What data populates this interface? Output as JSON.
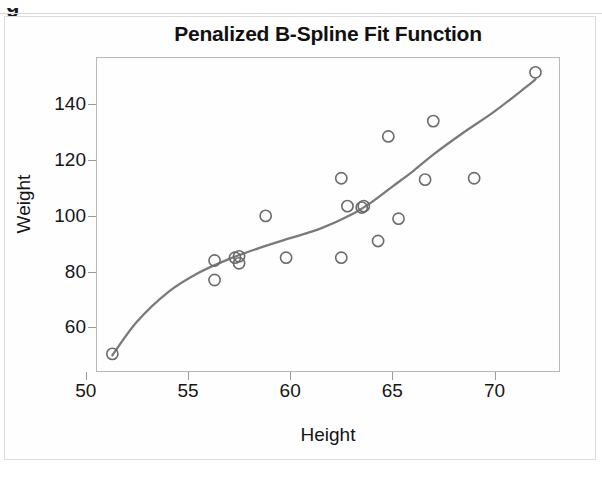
{
  "page": {
    "clipped_caption_glyph": "g"
  },
  "chart_data": {
    "type": "scatter",
    "title": "Penalized B-Spline Fit Function",
    "xlabel": "Height",
    "ylabel": "Weight",
    "xlim": [
      50.5,
      73.2
    ],
    "ylim": [
      44,
      157
    ],
    "xticks": [
      50,
      55,
      60,
      65,
      70
    ],
    "xticklabels": [
      "50",
      "55",
      "60",
      "65",
      "70"
    ],
    "yticks": [
      60,
      80,
      100,
      120,
      140
    ],
    "yticklabels": [
      "60",
      "80",
      "100",
      "120",
      "140"
    ],
    "grid": false,
    "legend": null,
    "marker_style": "open-circle",
    "marker_color": "#6b6b6b",
    "curve_color": "#7a7a7a",
    "series": [
      {
        "name": "Observations",
        "type": "scatter",
        "points": [
          [
            51.3,
            50.5
          ],
          [
            56.3,
            84.0
          ],
          [
            56.3,
            77.0
          ],
          [
            57.3,
            85.0
          ],
          [
            57.5,
            83.0
          ],
          [
            57.5,
            85.5
          ],
          [
            58.8,
            100.0
          ],
          [
            59.8,
            85.0
          ],
          [
            62.5,
            113.5
          ],
          [
            62.5,
            85.0
          ],
          [
            62.8,
            103.5
          ],
          [
            63.5,
            103.0
          ],
          [
            63.6,
            103.5
          ],
          [
            64.3,
            91.0
          ],
          [
            64.8,
            128.5
          ],
          [
            65.3,
            99.0
          ],
          [
            66.6,
            113.0
          ],
          [
            67.0,
            134.0
          ],
          [
            69.0,
            113.5
          ],
          [
            72.0,
            151.5
          ]
        ]
      },
      {
        "name": "Penalized B-Spline Fit",
        "type": "line",
        "points": [
          [
            51.3,
            50.0
          ],
          [
            52.5,
            62.0
          ],
          [
            54.0,
            72.5
          ],
          [
            55.5,
            79.5
          ],
          [
            57.0,
            84.5
          ],
          [
            58.5,
            88.5
          ],
          [
            60.0,
            92.0
          ],
          [
            61.5,
            95.5
          ],
          [
            63.0,
            100.5
          ],
          [
            64.0,
            105.0
          ],
          [
            65.0,
            110.5
          ],
          [
            66.0,
            116.0
          ],
          [
            67.0,
            122.0
          ],
          [
            68.5,
            130.0
          ],
          [
            70.0,
            137.5
          ],
          [
            71.5,
            146.0
          ],
          [
            72.0,
            149.0
          ]
        ]
      }
    ]
  }
}
